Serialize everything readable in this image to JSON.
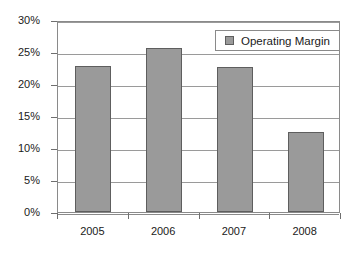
{
  "chart_data": {
    "type": "bar",
    "title": "",
    "xlabel": "",
    "ylabel": "",
    "categories": [
      "2005",
      "2006",
      "2007",
      "2008"
    ],
    "values": [
      22.8,
      25.7,
      22.7,
      12.5
    ],
    "series": [
      {
        "name": "Operating Margin",
        "values": [
          22.8,
          25.7,
          22.7,
          12.5
        ],
        "color": "#9a9a9a",
        "border_color": "#5e5e5e"
      }
    ],
    "ylim": [
      0,
      30
    ],
    "ytick_labels": [
      "0%",
      "5%",
      "10%",
      "15%",
      "20%",
      "25%",
      "30%"
    ],
    "ytick_values": [
      0,
      5,
      10,
      15,
      20,
      25,
      30
    ],
    "grid": true,
    "grid_axis": "y",
    "legend": {
      "position": "top-right",
      "entries": [
        {
          "label": "Operating Margin",
          "swatch_color": "#9a9a9a"
        }
      ]
    },
    "frame": true,
    "background_color": "#ffffff"
  }
}
